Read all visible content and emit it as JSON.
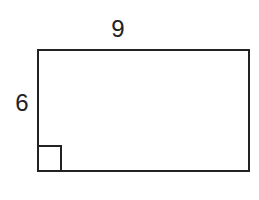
{
  "figure": {
    "shape": "rectangle",
    "top_label": "9",
    "left_label": "6",
    "right_angle_marker": "bottom-left",
    "stroke_color": "#222222",
    "background": "#ffffff"
  }
}
